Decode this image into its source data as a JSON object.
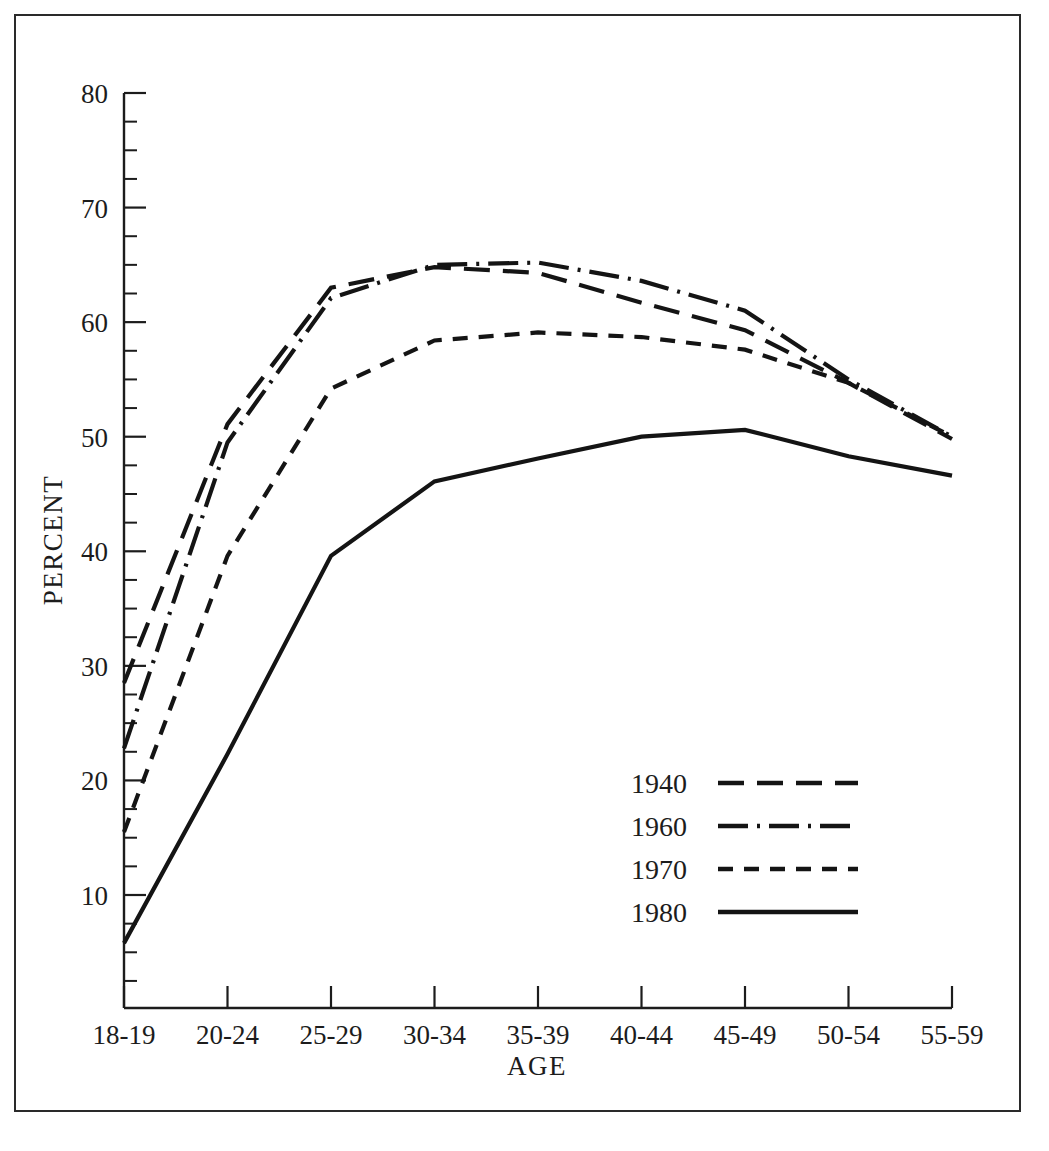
{
  "figure": {
    "has_border": true,
    "background": "#ffffff",
    "ink_color": "#141414"
  },
  "chart_data": {
    "type": "line",
    "title": "",
    "subtitle": "",
    "xlabel": "AGE",
    "ylabel": "PERCENT",
    "categories": [
      "18-19",
      "20-24",
      "25-29",
      "30-34",
      "35-39",
      "40-44",
      "45-49",
      "50-54",
      "55-59"
    ],
    "ylim": [
      0,
      80
    ],
    "y_major_ticks": [
      10,
      20,
      30,
      40,
      50,
      60,
      70,
      80
    ],
    "y_tick_labels": [
      "10",
      "20",
      "30",
      "40",
      "50",
      "60",
      "70",
      "80"
    ],
    "y_minor_interval": 2.5,
    "grid": false,
    "legend_position": "inside-lower-right",
    "series": [
      {
        "name": "1940",
        "dash": "long-dash",
        "dasharray": "26 13",
        "values": [
          28.5,
          51.1,
          63.0,
          64.8,
          64.3,
          61.7,
          59.3,
          54.7,
          49.8
        ]
      },
      {
        "name": "1960",
        "dash": "dash-dot",
        "dasharray": "30 9 3 9",
        "values": [
          22.8,
          49.5,
          62.1,
          65.0,
          65.2,
          63.6,
          61.0,
          55.0,
          50.0
        ]
      },
      {
        "name": "1970",
        "dash": "short-dash",
        "dasharray": "15 11",
        "values": [
          15.5,
          39.6,
          54.2,
          58.4,
          59.1,
          58.7,
          57.6,
          54.7,
          50.0
        ]
      },
      {
        "name": "1980",
        "dash": "solid",
        "dasharray": "none",
        "values": [
          5.8,
          22.3,
          39.6,
          46.1,
          48.1,
          50.0,
          50.6,
          48.3,
          46.6
        ]
      }
    ]
  },
  "legend": {
    "entries": [
      {
        "label": "1940"
      },
      {
        "label": "1960"
      },
      {
        "label": "1970"
      },
      {
        "label": "1980"
      }
    ]
  }
}
